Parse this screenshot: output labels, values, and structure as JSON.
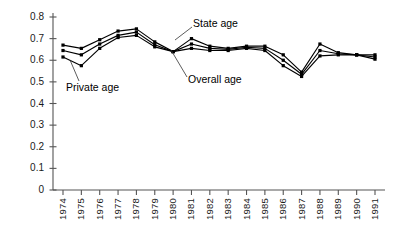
{
  "chart_data": {
    "type": "line",
    "title": "",
    "subtitle": "",
    "xlabel": "",
    "ylabel": "",
    "grid": false,
    "legend_position": "inline-annotations",
    "x": [
      1974,
      1975,
      1976,
      1977,
      1978,
      1979,
      1980,
      1981,
      1982,
      1983,
      1984,
      1985,
      1986,
      1987,
      1988,
      1989,
      1990,
      1991
    ],
    "xtick_labels": [
      "1974",
      "1975",
      "1976",
      "1977",
      "1978",
      "1979",
      "1980",
      "1981",
      "1982",
      "1983",
      "1984",
      "1985",
      "1986",
      "1987",
      "1988",
      "1989",
      "1990",
      "1991"
    ],
    "ytick_labels": [
      "0",
      "0.1",
      "0.2",
      "0.3",
      "0.4",
      "0.5",
      "0.6",
      "0.7",
      "0.8"
    ],
    "yticks": [
      0,
      0.1,
      0.2,
      0.3,
      0.4,
      0.5,
      0.6,
      0.7,
      0.8
    ],
    "ylim": [
      0,
      0.8
    ],
    "xlim": [
      1974,
      1991
    ],
    "series": [
      {
        "name": "State age",
        "values": [
          0.67,
          0.655,
          0.695,
          0.735,
          0.745,
          0.685,
          0.64,
          0.7,
          0.665,
          0.655,
          0.665,
          0.665,
          0.625,
          0.545,
          0.675,
          0.635,
          0.625,
          0.625
        ]
      },
      {
        "name": "Overall age",
        "values": [
          0.645,
          0.625,
          0.675,
          0.715,
          0.73,
          0.672,
          0.64,
          0.675,
          0.655,
          0.65,
          0.66,
          0.655,
          0.6,
          0.535,
          0.645,
          0.63,
          0.625,
          0.615
        ]
      },
      {
        "name": "Private age",
        "values": [
          0.615,
          0.575,
          0.655,
          0.705,
          0.715,
          0.662,
          0.64,
          0.655,
          0.645,
          0.645,
          0.655,
          0.645,
          0.575,
          0.525,
          0.62,
          0.625,
          0.625,
          0.605
        ]
      }
    ],
    "annotations": [
      {
        "text": "State age",
        "target_year": 1981,
        "target_value": 0.7
      },
      {
        "text": "Overall age",
        "target_year": 1981,
        "target_value": 0.675
      },
      {
        "text": "Private age",
        "target_year": 1975,
        "target_value": 0.575
      }
    ],
    "colors": {
      "line": "#000000",
      "axis": "#555555",
      "text": "#1a1a1a",
      "background": "#ffffff"
    }
  }
}
